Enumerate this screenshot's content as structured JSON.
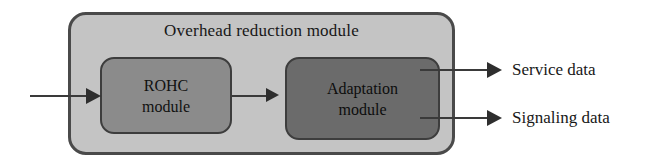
{
  "diagram": {
    "title": "Overhead reduction module",
    "container": {
      "label": "Overhead reduction module",
      "fill_color": "#c4c4c4",
      "border_color": "#4a4a4a"
    },
    "modules": [
      {
        "id": "rohc",
        "label": "ROHC\nmodule",
        "fill_color": "#8b8b8b",
        "border_color": "#3d3d3d"
      },
      {
        "id": "adaptation",
        "label": "Adaptation\nmodule",
        "fill_color": "#6b6b6b",
        "border_color": "#3d3d3d"
      }
    ],
    "connectors": [
      {
        "id": "input",
        "label": "",
        "from": "external",
        "to": "rohc"
      },
      {
        "id": "rohc-to-adaptation",
        "label": "",
        "from": "rohc",
        "to": "adaptation"
      },
      {
        "id": "service-output",
        "label": "Service data",
        "from": "adaptation",
        "to": "external"
      },
      {
        "id": "signaling-output",
        "label": "Signaling data",
        "from": "adaptation",
        "to": "external"
      }
    ],
    "outputs": {
      "service": "Service data",
      "signaling": "Signaling data"
    },
    "line_color": "#3a3a3a",
    "arrow_color": "#2e2e2e",
    "text_color": "#171717"
  }
}
